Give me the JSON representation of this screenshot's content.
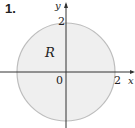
{
  "figure": {
    "problem_number": "1.",
    "region_label": "R",
    "axes": {
      "x_label": "x",
      "y_label": "y",
      "origin_label": "0",
      "x_tick": "2",
      "y_tick": "2"
    },
    "circle": {
      "center": [
        0,
        0
      ],
      "radius": 2,
      "fill": "#efefef",
      "stroke": "#bdbdbd"
    }
  }
}
